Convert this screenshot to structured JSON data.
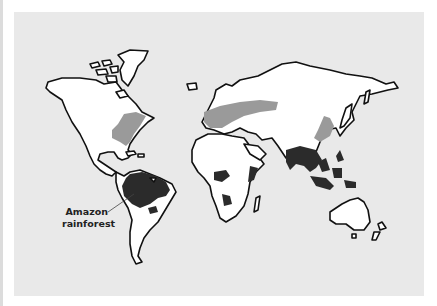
{
  "map": {
    "type": "world map of forest regions",
    "colors": {
      "background": "#e9e9e9",
      "land": "#ffffff",
      "outline": "#111111",
      "temperate_forest": "#9a9a9a",
      "tropical_rainforest": "#2b2b2b"
    },
    "annotations": [
      {
        "line1": "Amazon",
        "line2": "rainforest"
      }
    ]
  }
}
